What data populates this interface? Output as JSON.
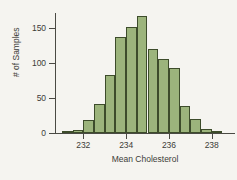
{
  "chart_data": {
    "type": "bar",
    "title": "",
    "subtitle": "",
    "xlabel": "Mean Cholesterol",
    "ylabel": "# of Samples",
    "xlim": [
      230.9,
      238.6
    ],
    "ylim": [
      0,
      175
    ],
    "grid": false,
    "legend": null,
    "bin_width": 0.5,
    "categories": [
      "231.25",
      "231.75",
      "232.25",
      "232.75",
      "233.25",
      "233.75",
      "234.25",
      "234.75",
      "235.25",
      "235.75",
      "236.25",
      "236.75",
      "237.25",
      "237.75",
      "238.25"
    ],
    "bin_starts": [
      231.0,
      231.5,
      232.0,
      232.5,
      233.0,
      233.5,
      234.0,
      234.5,
      235.0,
      235.5,
      236.0,
      236.5,
      237.0,
      237.5,
      238.0
    ],
    "values": [
      2,
      5,
      18,
      42,
      82,
      137,
      151,
      167,
      119,
      105,
      92,
      38,
      20,
      6,
      2
    ],
    "x_ticks": [
      232,
      234,
      236,
      238
    ],
    "x_tick_labels": [
      "232",
      "234",
      "236",
      "238"
    ],
    "y_ticks": [
      0,
      50,
      100,
      150
    ],
    "y_tick_labels": [
      "0",
      "50",
      "100",
      "150"
    ],
    "bar_fill_color": "#9cb47c",
    "bar_edge_color": "#3d4c2b",
    "axis_color": "#4a4a44",
    "background_color": "#f5f4f0"
  }
}
